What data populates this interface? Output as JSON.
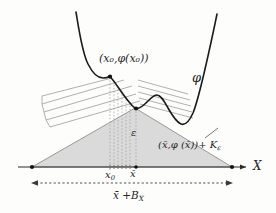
{
  "figure": {
    "kind": "math-diagram",
    "background_color": "#fdfdfc",
    "ink_color": "#262626",
    "curve_color": "#1a1a1a",
    "cone_fill_color": "#d9d9d9",
    "cone_edge_color": "#8c8c8c",
    "hatch_color": "#9a9a9a",
    "dotted_color": "#a0a0a0"
  },
  "labels": {
    "point_x0": "(x₀,φ(x₀))",
    "curve_phi": "φ",
    "epsilon": "ε",
    "cone": "(x̄,φ (x̄))+ K",
    "cone_sub": "ε",
    "tick_x0": "x",
    "tick_x0_sub": "0",
    "tick_xbar": "x̄",
    "axis_x": "X",
    "width_bar": "x̄ +B",
    "width_bar_sub": "X"
  },
  "geometry": {
    "axis": {
      "x1": 18,
      "x2": 248,
      "y": 167
    },
    "triangle": {
      "left_x": 32,
      "right_x": 232,
      "apex_x": 135,
      "apex_y": 108,
      "base_y": 167
    },
    "tick_x0_x": 110,
    "tick_xbar_x": 136,
    "dim_line": {
      "x1": 32,
      "x2": 232,
      "y": 183
    },
    "marked_points": [
      {
        "name": "x0-on-curve",
        "x": 110,
        "y": 77
      },
      {
        "name": "xbar-on-curve",
        "x": 135,
        "y": 108
      },
      {
        "name": "triangle-left-vertex",
        "x": 32,
        "y": 167
      },
      {
        "name": "triangle-right-vertex",
        "x": 232,
        "y": 167
      }
    ],
    "curve_path": "M 76,12 C 79,30 82,52 88,64 C 92,72 97,78 103,78 C 107,78 109,77 110,76.5 C 116,83 122,94 130,103 C 133,107 135,108.5 137,108.5 C 141,108.5 145,104 149,100 C 152,97 154,95 157,95 C 161,95 164,101 168,108 C 172,115 176,122 181,124 C 185,125.5 189,122 193,113 C 198,101 203,78 208,56 C 212,38 215,24 217,14",
    "dotted_verticals_x": [
      110,
      114,
      118,
      122,
      126,
      130,
      136
    ],
    "hatch_lines": [
      {
        "x1": 42,
        "y1": 96,
        "x2": 112,
        "y2": 78
      },
      {
        "x1": 42,
        "y1": 104,
        "x2": 124,
        "y2": 80
      },
      {
        "x1": 44,
        "y1": 112,
        "x2": 132,
        "y2": 86
      },
      {
        "x1": 46,
        "y1": 120,
        "x2": 136,
        "y2": 94
      },
      {
        "x1": 50,
        "y1": 127,
        "x2": 140,
        "y2": 101
      }
    ],
    "hatch_lines_right": [
      {
        "x1": 140,
        "y1": 82,
        "x2": 186,
        "y2": 96
      },
      {
        "x1": 140,
        "y1": 88,
        "x2": 188,
        "y2": 102
      },
      {
        "x1": 140,
        "y1": 94,
        "x2": 190,
        "y2": 108
      },
      {
        "x1": 141,
        "y1": 100,
        "x2": 191,
        "y2": 114
      },
      {
        "x1": 142,
        "y1": 106,
        "x2": 192,
        "y2": 120
      }
    ]
  }
}
